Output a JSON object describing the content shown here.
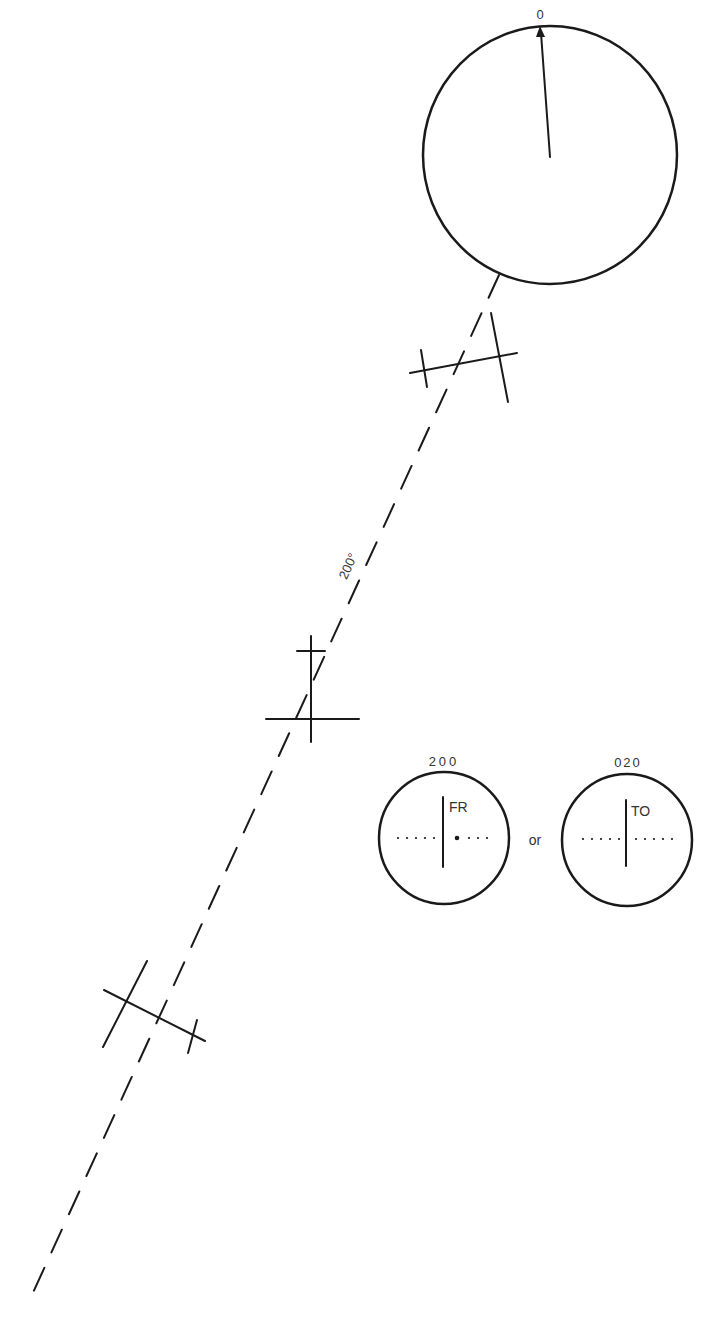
{
  "diagram": {
    "heading_indicator": {
      "heading_label": "0",
      "center": [
        550,
        155
      ],
      "radius": 127
    },
    "course_line": {
      "label": "200°",
      "from": [
        499,
        275
      ],
      "to": [
        31,
        1297
      ],
      "style": "dashed"
    },
    "aircraft": [
      {
        "name": "aircraft-1",
        "position": [
          460,
          360
        ]
      },
      {
        "name": "aircraft-2",
        "position": [
          311,
          690
        ]
      },
      {
        "name": "aircraft-3",
        "position": [
          155,
          1015
        ]
      }
    ],
    "cdi_indicators": [
      {
        "obs_setting": "200",
        "flag": "FR",
        "needle": "centered",
        "center": [
          444,
          838
        ]
      },
      {
        "obs_setting": "020",
        "flag": "TO",
        "needle": "centered",
        "center": [
          627,
          840
        ]
      }
    ],
    "connector_text": "or"
  },
  "colors": {
    "ink": "#1a1a1a",
    "text": "#333333",
    "background": "#ffffff"
  }
}
